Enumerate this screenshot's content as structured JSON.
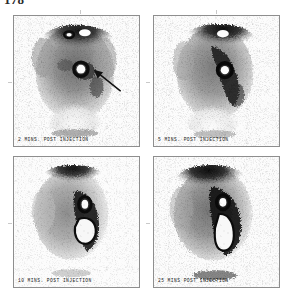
{
  "page": {
    "number": "178",
    "background_color": "#ffffff",
    "ink_color": "#1b1b1b"
  },
  "plate": {
    "rows": 2,
    "columns": 2,
    "frame_border_color": "#8e8e8e",
    "panels": [
      {
        "id": "panel-2min",
        "caption": "2 MINS. POST INJECTION",
        "timepoint_minutes": 2,
        "annotation": "arrow",
        "markers": [
          "ring-marker",
          "ring-marker"
        ]
      },
      {
        "id": "panel-5min",
        "caption": "5 MINS. POST INJECTION",
        "timepoint_minutes": 5,
        "annotation": "none",
        "markers": [
          "ring-marker"
        ]
      },
      {
        "id": "panel-10min",
        "caption": "10 MINS. POST INJECTION",
        "timepoint_minutes": 10,
        "annotation": "none",
        "markers": [
          "ring-marker"
        ]
      },
      {
        "id": "panel-25min",
        "caption": "25 MINS POST INJECTION",
        "timepoint_minutes": 25,
        "annotation": "none",
        "markers": [
          "ring-marker"
        ]
      }
    ]
  }
}
